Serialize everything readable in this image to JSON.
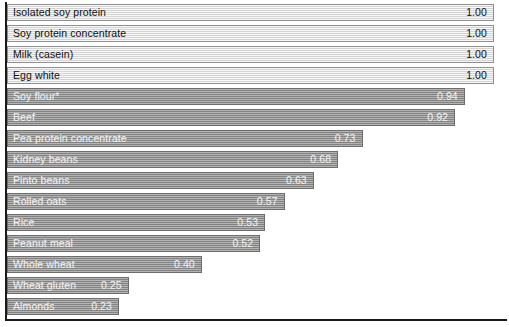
{
  "chart_data": {
    "type": "bar",
    "orientation": "horizontal",
    "title": "",
    "subtitle": "",
    "xlabel": "",
    "ylabel": "",
    "xlim": [
      0,
      1.0
    ],
    "grid": false,
    "legend": null,
    "value_format": "0.00",
    "categories": [
      "Isolated soy protein",
      "Soy protein concentrate",
      "Milk (casein)",
      "Egg white",
      "Soy flour*",
      "Beef",
      "Pea protein concentrate",
      "Kidney beans",
      "Pinto beans",
      "Rolled oats",
      "Rice",
      "Peanut meal",
      "Whole wheat",
      "Wheat gluten",
      "Almonds"
    ],
    "values": [
      1.0,
      1.0,
      1.0,
      1.0,
      0.94,
      0.92,
      0.73,
      0.68,
      0.63,
      0.57,
      0.53,
      0.52,
      0.4,
      0.25,
      0.23
    ],
    "value_labels": [
      "1.00",
      "1.00",
      "1.00",
      "1.00",
      "0.94",
      "0.92",
      "0.73",
      "0.68",
      "0.63",
      "0.57",
      "0.53",
      "0.52",
      "0.40",
      "0.25",
      "0.23"
    ]
  },
  "style": {
    "bar_light_fill": "#e2e2e2",
    "bar_dark_fill": "#949494",
    "bar_light_text": "#101010",
    "bar_dark_text": "#f4f4f4",
    "axis_color": "#1a1a1a",
    "background": "#ffffff"
  }
}
